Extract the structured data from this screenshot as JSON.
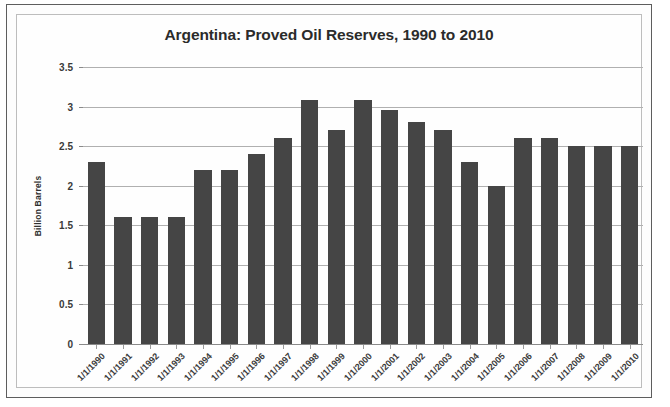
{
  "chart_data": {
    "type": "bar",
    "title": "Argentina: Proved Oil Reserves, 1990 to 2010",
    "xlabel": "",
    "ylabel": "Billion Barrels",
    "ylim": [
      0,
      3.5
    ],
    "ytick_step": 0.5,
    "yticks": [
      "3.5",
      "3",
      "2.5",
      "2",
      "1.5",
      "1",
      "0.5",
      "0"
    ],
    "ytick_values": [
      3.5,
      3,
      2.5,
      2,
      1.5,
      1,
      0.5,
      0
    ],
    "grid": true,
    "legend": "none",
    "bar_color": "#454545",
    "gridline_color": "#b0b0b0",
    "categories": [
      "1/1/1990",
      "1/1/1991",
      "1/1/1992",
      "1/1/1993",
      "1/1/1994",
      "1/1/1995",
      "1/1/1996",
      "1/1/1997",
      "1/1/1998",
      "1/1/1999",
      "1/1/2000",
      "1/1/2001",
      "1/1/2002",
      "1/1/2003",
      "1/1/2004",
      "1/1/2005",
      "1/1/2006",
      "1/1/2007",
      "1/1/2008",
      "1/1/2009",
      "1/1/2010"
    ],
    "values": [
      2.3,
      1.6,
      1.6,
      1.6,
      2.2,
      2.2,
      2.4,
      2.6,
      3.08,
      2.7,
      3.08,
      2.96,
      2.8,
      2.7,
      2.3,
      2.0,
      2.6,
      2.6,
      2.5,
      2.5,
      2.5
    ]
  }
}
